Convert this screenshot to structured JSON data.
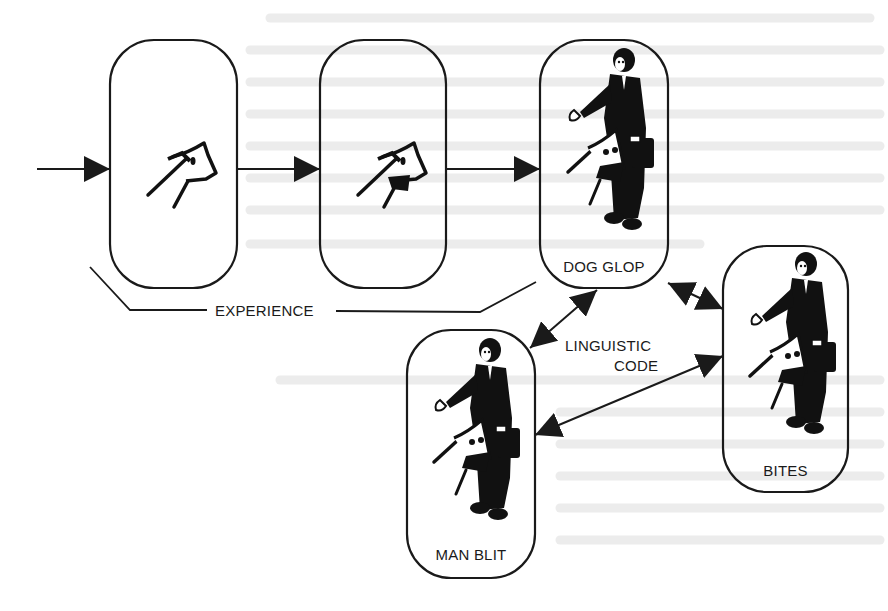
{
  "diagram": {
    "nodes": [
      {
        "id": "exp1",
        "label": "",
        "content": "dog-head-sketch",
        "x": 110,
        "y": 40,
        "w": 127,
        "h": 248
      },
      {
        "id": "exp2",
        "label": "",
        "content": "dog-head-biting-sketch",
        "x": 320,
        "y": 40,
        "w": 126,
        "h": 248
      },
      {
        "id": "dog_glop",
        "label": "DOG GLOP",
        "content": "man-and-dog-silhouette",
        "x": 540,
        "y": 40,
        "w": 128,
        "h": 248
      },
      {
        "id": "bites",
        "label": "BITES",
        "content": "man-and-dog-silhouette",
        "x": 723,
        "y": 246,
        "w": 125,
        "h": 246
      },
      {
        "id": "man_blit",
        "label": "MAN BLIT",
        "content": "man-and-dog-silhouette",
        "x": 407,
        "y": 330,
        "w": 128,
        "h": 248
      }
    ],
    "edges": [
      {
        "from": "input",
        "to": "exp1",
        "type": "arrow"
      },
      {
        "from": "exp1",
        "to": "exp2",
        "type": "arrow"
      },
      {
        "from": "exp2",
        "to": "dog_glop",
        "type": "arrow"
      },
      {
        "from": "dog_glop",
        "to": "bites",
        "type": "double-arrow"
      },
      {
        "from": "dog_glop",
        "to": "man_blit",
        "type": "double-arrow"
      },
      {
        "from": "man_blit",
        "to": "bites",
        "type": "double-arrow"
      }
    ],
    "annotations": {
      "experience": "EXPERIENCE",
      "linguistic_line1": "LINGUISTIC",
      "linguistic_line2": "CODE"
    },
    "colors": {
      "ink": "#1a1a1a",
      "paper": "#ffffff",
      "bleed": "#e6e6e6"
    }
  }
}
